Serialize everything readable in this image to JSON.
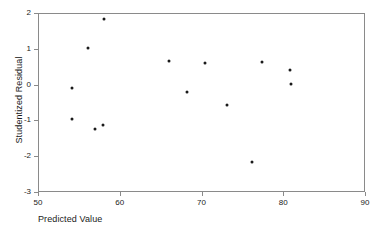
{
  "chart_data": {
    "type": "scatter",
    "title": "",
    "xlabel": "Predicted Value",
    "ylabel": "Studentized Residual",
    "xlim": [
      50,
      90
    ],
    "ylim": [
      -3,
      2
    ],
    "xticks": [
      50,
      60,
      70,
      80,
      90
    ],
    "yticks": [
      2,
      1,
      0,
      -1,
      -2,
      -3
    ],
    "xtick_labels": [
      "50",
      "60",
      "70",
      "80",
      "90"
    ],
    "ytick_labels": [
      "2",
      "1",
      "0",
      "-1",
      "-2",
      "-3"
    ],
    "grid": false,
    "legend": null,
    "marker": "filled-circle",
    "marker_color": "#1a1a1a",
    "frame_color": "#8a8a8a",
    "points": [
      {
        "x": 58.1,
        "y": 1.83
      },
      {
        "x": 56.1,
        "y": 1.02
      },
      {
        "x": 54.2,
        "y": -0.09
      },
      {
        "x": 54.2,
        "y": -0.96
      },
      {
        "x": 57.0,
        "y": -1.24
      },
      {
        "x": 58.0,
        "y": -1.13
      },
      {
        "x": 66.0,
        "y": 0.66
      },
      {
        "x": 68.2,
        "y": -0.21
      },
      {
        "x": 70.4,
        "y": 0.6
      },
      {
        "x": 73.1,
        "y": -0.57
      },
      {
        "x": 76.2,
        "y": -2.16
      },
      {
        "x": 77.4,
        "y": 0.63
      },
      {
        "x": 80.8,
        "y": 0.41
      },
      {
        "x": 80.9,
        "y": 0.02
      }
    ]
  }
}
